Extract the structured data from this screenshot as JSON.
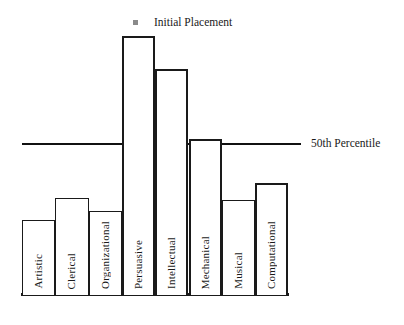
{
  "legend": {
    "marker_icon": "square-marker-icon",
    "label": "Initial Placement"
  },
  "reference_line": {
    "label": "50th Percentile",
    "value": 50
  },
  "colors": {
    "bar_outline": "#1a1a1a",
    "bar_fill": "#ffffff",
    "line": "#111111",
    "background": "#ffffff",
    "marker": "#8a8a8a"
  },
  "chart_data": {
    "type": "bar",
    "title": "Initial Placement",
    "xlabel": "",
    "ylabel": "",
    "ylim": [
      0,
      87
    ],
    "grid": false,
    "legend_position": "top",
    "annotations": [
      "50th Percentile"
    ],
    "categories": [
      "Artistic",
      "Clerical",
      "Organizational",
      "Persuasive",
      "Intellectual",
      "Mechanical",
      "Musical",
      "Computational"
    ],
    "values": [
      25,
      33,
      28,
      87,
      76,
      52,
      32,
      38
    ],
    "series": [
      {
        "name": "Initial Placement",
        "values": [
          25,
          33,
          28,
          87,
          76,
          52,
          32,
          38
        ]
      }
    ]
  },
  "bars": [
    {
      "label": "Artistic",
      "value": 25,
      "height_px": 75,
      "emphasis": false
    },
    {
      "label": "Clerical",
      "value": 33,
      "height_px": 97,
      "emphasis": false
    },
    {
      "label": "Organizational",
      "value": 28,
      "height_px": 84,
      "emphasis": false
    },
    {
      "label": "Persuasive",
      "value": 87,
      "height_px": 259,
      "emphasis": true
    },
    {
      "label": "Intellectual",
      "value": 76,
      "height_px": 226,
      "emphasis": true
    },
    {
      "label": "Mechanical",
      "value": 52,
      "height_px": 156,
      "emphasis": true
    },
    {
      "label": "Musical",
      "value": 32,
      "height_px": 95,
      "emphasis": false
    },
    {
      "label": "Computational",
      "value": 38,
      "height_px": 112,
      "emphasis": true
    }
  ]
}
